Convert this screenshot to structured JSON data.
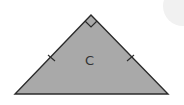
{
  "diagram": {
    "shape": "isosceles right triangle",
    "label": "C",
    "fill_color": "#a9a9a9",
    "stroke_color": "#2b2b2b",
    "vertices": {
      "apex": [
        91,
        15
      ],
      "base_left": [
        15,
        94
      ],
      "base_right": [
        168,
        94
      ]
    },
    "markers": [
      "right-angle at apex",
      "tick on left leg",
      "tick on right leg"
    ]
  }
}
